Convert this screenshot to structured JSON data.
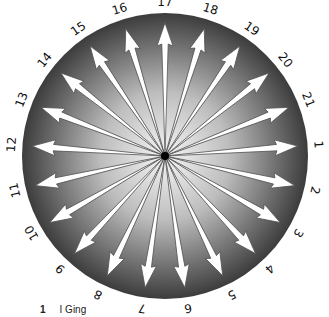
{
  "figure": {
    "caption_number": "1",
    "caption_text": "I Ging",
    "labels": [
      "1",
      "2",
      "3",
      "4",
      "5",
      "6",
      "7",
      "8",
      "9",
      "10",
      "11",
      "12",
      "13",
      "14",
      "15",
      "16",
      "17",
      "18",
      "19",
      "20",
      "21"
    ],
    "colors": {
      "disk_outer": "#3a3a3a",
      "disk_inner": "#f4f4f4",
      "arrow_fill": "#ffffff",
      "arrow_stroke": "#555555",
      "center": "#000000"
    }
  }
}
